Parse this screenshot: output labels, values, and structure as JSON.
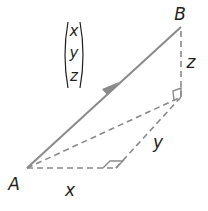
{
  "diagram": {
    "type": "3d-vector-decomposition",
    "points": {
      "A": {
        "label": "A",
        "x": 27,
        "y": 168
      },
      "B": {
        "label": "B",
        "x": 181,
        "y": 26
      },
      "C": {
        "label": "",
        "x": 181,
        "y": 97
      },
      "D": {
        "label": "",
        "x": 116,
        "y": 168
      }
    },
    "vector": {
      "from": "A",
      "to": "B",
      "style": "solid-arrow",
      "color": "#8a8a8a"
    },
    "column_vector": {
      "components": [
        "x",
        "y",
        "z"
      ]
    },
    "edges": [
      {
        "name": "x",
        "label": "x",
        "from": "A",
        "to": "D",
        "style": "dashed"
      },
      {
        "name": "y",
        "label": "y",
        "from": "D",
        "to": "C",
        "style": "dashed"
      },
      {
        "name": "z",
        "label": "z",
        "from": "C",
        "to": "B",
        "style": "dashed"
      },
      {
        "name": "diagonal",
        "label": "",
        "from": "A",
        "to": "C",
        "style": "dashed"
      }
    ],
    "right_angles": [
      "D",
      "C"
    ],
    "colors": {
      "line": "#8a8a8a",
      "text": "#231f20",
      "background": "#ffffff"
    }
  }
}
